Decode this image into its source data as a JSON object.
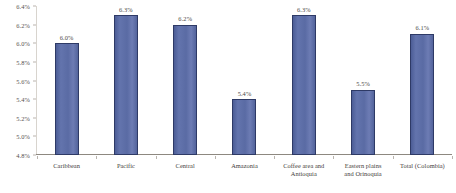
{
  "chart_data": {
    "type": "bar",
    "title": "",
    "subtitle": "",
    "xlabel": "",
    "ylabel": "",
    "categories": [
      "Caribbean",
      "Pacific",
      "Central",
      "Amazonia",
      "Coffee area and Antioquia",
      "Eastern plains and Orinoquia",
      "Total (Colombia)"
    ],
    "category_lines": [
      [
        "Caribbean"
      ],
      [
        "Pacific"
      ],
      [
        "Central"
      ],
      [
        "Amazonia"
      ],
      [
        "Coffee area and",
        "Antioquia"
      ],
      [
        "Eastern plains",
        "and Orinoquia"
      ],
      [
        "Total (Colombia)"
      ]
    ],
    "values": [
      6.0,
      6.3,
      6.2,
      5.4,
      6.3,
      5.5,
      6.1
    ],
    "value_labels": [
      "6.0%",
      "6.3%",
      "6.2%",
      "5.4%",
      "6.3%",
      "5.5%",
      "6.1%"
    ],
    "ylim": [
      4.8,
      6.4
    ],
    "ytick_values": [
      6.4,
      6.2,
      6.0,
      5.8,
      5.6,
      5.4,
      5.2,
      5.0,
      4.8
    ],
    "ytick_labels": [
      "6.4%",
      "6.2%",
      "6.0%",
      "5.8%",
      "5.6%",
      "5.4%",
      "5.2%",
      "5.0%",
      "4.8%"
    ],
    "grid": false,
    "legend": false,
    "bar_fill_color": "#5b6ba4",
    "bar_border_color": "#2e3a66",
    "axis_color": "#8d8880",
    "text_color": "#3f3d3b",
    "background_color": "#ffffff"
  }
}
